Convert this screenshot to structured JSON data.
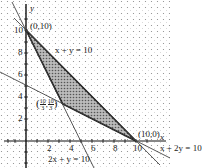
{
  "diagram": {
    "type": "linear-programming feasible region",
    "axes": {
      "x_label": "x",
      "y_label": "y",
      "x_ticks": [
        "2",
        "4",
        "6",
        "8",
        "10"
      ],
      "y_ticks": [
        "2",
        "4",
        "6",
        "8",
        "10"
      ]
    },
    "lines": [
      {
        "equation": "x + y = 10"
      },
      {
        "equation": "2x + y = 10"
      },
      {
        "equation": "x + 2y = 10"
      }
    ],
    "vertices": [
      {
        "label": "(0,10)",
        "x": 0,
        "y": 10
      },
      {
        "label": "(10/3, 10/3)",
        "x": 3.333,
        "y": 3.333
      },
      {
        "label": "(10,0)",
        "x": 10,
        "y": 0
      }
    ],
    "labels": {
      "line1": "x + y = 10",
      "line2": "2x + y = 10",
      "line3": "x + 2y = 10",
      "v1": "(0,10)",
      "v2_open": "(",
      "v2_num1": "10",
      "v2_den1": "3",
      "v2_num2": "10",
      "v2_den2": "3",
      "v2_close": ")",
      "v3": "(10,0)",
      "x_axis": "x",
      "y_axis": "y",
      "tick_x2": "2",
      "tick_x4": "4",
      "tick_x6": "6",
      "tick_x8": "8",
      "tick_x10": "10",
      "tick_y2": "2",
      "tick_y4": "4",
      "tick_y6": "6",
      "tick_y8": "8",
      "tick_y10": "10"
    }
  }
}
